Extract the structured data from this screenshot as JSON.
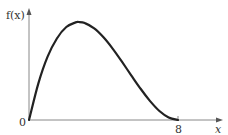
{
  "chart_data": {
    "type": "line",
    "title": "",
    "xlabel": "x",
    "ylabel": "f(x)",
    "x_ticks": [
      "0",
      "8"
    ],
    "xlim": [
      0,
      8
    ],
    "grid": false,
    "legend": null,
    "series": [
      {
        "name": "f(x)",
        "x": [
          0,
          0.5,
          1,
          1.5,
          2,
          2.5,
          2.67,
          3,
          3.5,
          4,
          4.5,
          5,
          5.5,
          6,
          6.5,
          7,
          7.5,
          8
        ],
        "y": [
          0,
          0.371,
          0.646,
          0.832,
          0.949,
          0.996,
          1.0,
          0.989,
          0.935,
          0.844,
          0.727,
          0.593,
          0.453,
          0.316,
          0.193,
          0.092,
          0.025,
          0
        ]
      }
    ],
    "y_normalized": true
  },
  "labels": {
    "y_axis": "f(x)",
    "x_axis": "x",
    "origin": "0",
    "x_end": "8"
  },
  "colors": {
    "curve": "#222222",
    "axes": "#777777",
    "text": "#333333"
  }
}
